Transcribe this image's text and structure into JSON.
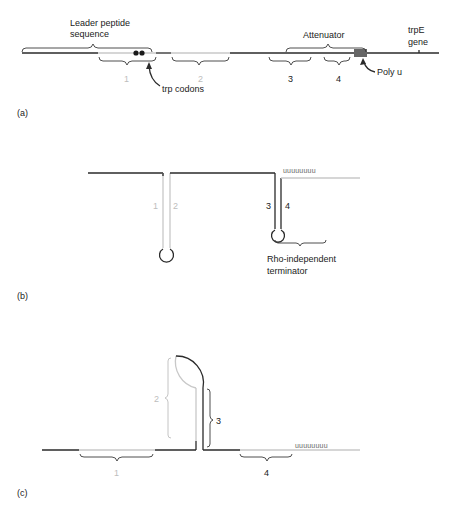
{
  "panels": {
    "a": {
      "label": "(a)",
      "leader_label_line1": "Leader peptide",
      "leader_label_line2": "sequence",
      "attenuator_label": "Attenuator",
      "trpE_line1": "trpE",
      "trpE_line2": "gene",
      "region_labels": [
        "1",
        "2",
        "3",
        "4"
      ],
      "trp_codons_label": "trp codons",
      "poly_u_label": "Poly u"
    },
    "b": {
      "label": "(b)",
      "stem_labels": [
        "1",
        "2",
        "3",
        "4"
      ],
      "uuu": "uuuuuuuu",
      "terminator_line1": "Rho-independent",
      "terminator_line2": "terminator"
    },
    "c": {
      "label": "(c)",
      "region_labels": [
        "1",
        "2",
        "3",
        "4"
      ],
      "uuu": "uuuuuuuu"
    }
  },
  "colors": {
    "dark_strand": "#2a2a2a",
    "light_strand": "#c8c8c8",
    "poly_u_box": "#666666"
  }
}
